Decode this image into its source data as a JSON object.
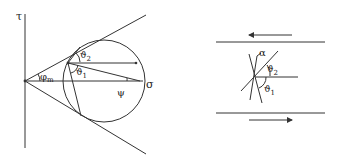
{
  "mohr_diagram": {
    "axis_vertical_label": "τ",
    "axis_horizontal_label": "σ",
    "friction_angle_label": "φ",
    "friction_angle_subscript": "m",
    "angle_theta2_label": "ϑ",
    "angle_theta2_subscript": "2",
    "angle_theta1_label": "ϑ",
    "angle_theta1_subscript": "1",
    "angle_psi_label": "ψ"
  },
  "shear_zone_diagram": {
    "angle_alpha_label": "α",
    "angle_theta2_label": "ϑ",
    "angle_theta2_subscript": "2",
    "angle_theta1_label": "ϑ",
    "angle_theta1_subscript": "1",
    "top_arrow_direction": "left",
    "bottom_arrow_direction": "right"
  },
  "colors": {
    "line": "#333333",
    "background": "#ffffff"
  }
}
